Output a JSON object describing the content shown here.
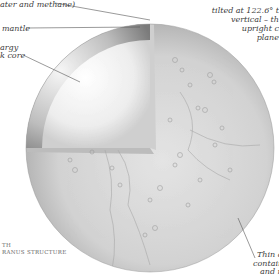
{
  "diagram": {
    "colors": {
      "background": "#ffffff",
      "surface": "#d9d9d9",
      "rim_shadow": "#8a8a8a",
      "core": "#f4f4f4",
      "leader_line": "#555555"
    }
  },
  "labels": {
    "atmosphere_partial": "ater and methane)",
    "mantle": "mantle",
    "core_line1": "argy",
    "core_line2": "k core",
    "tilt_line1": "tilted at 122.6° t",
    "tilt_line2": "vertical – th",
    "tilt_line3": "upright c",
    "tilt_line4": "plane",
    "thin_line1": "Thin atm",
    "thin_line2": "containing",
    "thin_line3": "and ni"
  },
  "caption": {
    "line1": "TH",
    "line2": "RANUS STRUCTURE"
  }
}
